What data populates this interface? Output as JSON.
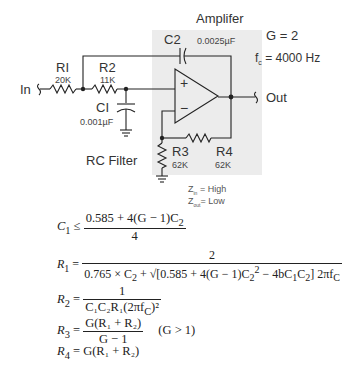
{
  "diagram": {
    "sections": {
      "amplifier_label": "Amplifer",
      "rc_filter_label": "RC Filter"
    },
    "params": {
      "gain": "G = 2",
      "cutoff_prefix": "f",
      "cutoff_sub": "c",
      "cutoff_value": " = 4000 Hz"
    },
    "terminals": {
      "input": "In",
      "output": "Out"
    },
    "components": {
      "R1": {
        "name": "RI",
        "value": "20K"
      },
      "R2": {
        "name": "R2",
        "value": "11K"
      },
      "C1": {
        "name": "CI",
        "value": "0.001µF"
      },
      "C2": {
        "name": "C2",
        "value": "0.0025µF"
      },
      "R3": {
        "name": "R3",
        "value": "62K"
      },
      "R4": {
        "name": "R4",
        "value": "62K"
      }
    },
    "opamp": {
      "plus": "+",
      "minus": "−"
    },
    "impedance": {
      "zin_sym": "Z",
      "zin_sub": "in",
      "zin_val": " = High",
      "zout_sym": "Z",
      "zout_sub": "out",
      "zout_val": "= Low"
    },
    "colors": {
      "amp_box": "#ececec",
      "wire": "#222222"
    }
  },
  "equations": {
    "c1": {
      "lhs": "C",
      "lhs_sub": "1",
      "op": " ≤ ",
      "num": "0.585 + 4(G − 1)C",
      "num_sub": "2",
      "den": "4"
    },
    "r1": {
      "lhs": "R",
      "lhs_sub": "1",
      "op": " = ",
      "num": "2",
      "den_a": "0.765 × C",
      "den_a_sub": "2",
      "den_b": " + √[0.585 + 4(G − 1)C",
      "den_b_sub": "2",
      "den_b_sup": "2",
      "den_c": " − 4bC",
      "den_c_sub1": "1",
      "den_c_mid": "C",
      "den_c_sub2": "2",
      "den_d": "] 2πf",
      "den_d_sub": "C"
    },
    "r2": {
      "lhs": "R",
      "lhs_sub": "2",
      "op": " = ",
      "num": "1",
      "den": "C₁C₂R₁(2πf",
      "den_sub": "C",
      "den_end": ")²"
    },
    "r3": {
      "lhs": "R",
      "lhs_sub": "3",
      "op": " = ",
      "num": "G(R₁ + R₂)",
      "den": "G − 1",
      "cond": "(G > 1)"
    },
    "r4": {
      "lhs": "R",
      "lhs_sub": "4",
      "op": " = ",
      "rhs": "G(R₁ + R₂)"
    }
  }
}
